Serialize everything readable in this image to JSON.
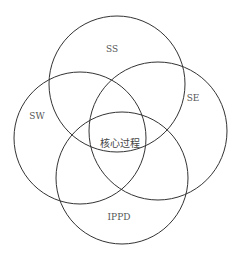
{
  "diagram": {
    "type": "venn",
    "stroke_color": "#333333",
    "background": "#ffffff",
    "circles": [
      {
        "id": "ss",
        "label": "SS",
        "cx": 117,
        "cy": 84,
        "r": 68
      },
      {
        "id": "sw",
        "label": "SW",
        "cx": 80,
        "cy": 138,
        "r": 66
      },
      {
        "id": "se",
        "label": "SE",
        "cx": 158,
        "cy": 131,
        "r": 69
      },
      {
        "id": "ippd",
        "label": "IPPD",
        "cx": 122,
        "cy": 178,
        "r": 66
      }
    ],
    "labels": {
      "ss": {
        "text": "SS",
        "x": 112,
        "y": 49
      },
      "sw": {
        "text": "SW",
        "x": 37,
        "y": 116
      },
      "se": {
        "text": "SE",
        "x": 193,
        "y": 98
      },
      "ippd": {
        "text": "IPPD",
        "x": 119,
        "y": 217
      },
      "core": {
        "text": "核心过程",
        "x": 120,
        "y": 144
      }
    }
  }
}
